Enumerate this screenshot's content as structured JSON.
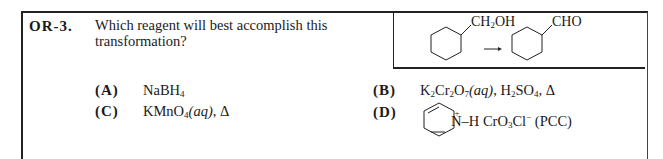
{
  "question": {
    "number": "OR-3.",
    "text": "Which reagent will best accomplish this transformation?"
  },
  "reaction": {
    "reactant_group": "CH2OH",
    "product_group": "CHO",
    "arrow": "→",
    "ring": "cyclohexane"
  },
  "options": [
    {
      "letter": "(A)",
      "text": "NaBH4"
    },
    {
      "letter": "(B)",
      "text": "K2Cr2O7(aq), H2SO4, Δ"
    },
    {
      "letter": "(C)",
      "text": "KMnO4(aq), Δ"
    },
    {
      "letter": "(D)",
      "text": "pyridinium N+–H CrO3Cl− (PCC)"
    }
  ],
  "labels": {
    "A_main": "NaBH",
    "A_sub": "4",
    "B_K": "K",
    "B_s1": "2",
    "B_Cr": "Cr",
    "B_s2": "2",
    "B_O": "O",
    "B_s3": "7",
    "B_aq": "(aq)",
    "B_rest1": ", H",
    "B_s4": "2",
    "B_SO": "SO",
    "B_s5": "4",
    "B_rest2": ", Δ",
    "C_main": "KMnO",
    "C_sub": "4",
    "C_aq": "(aq)",
    "C_rest": ", Δ",
    "D_N": "N",
    "D_plus": "+",
    "D_H": "–H",
    "D_Cr": "CrO",
    "D_s1": "3",
    "D_Cl": "Cl",
    "D_minus": "−",
    "D_pcc": " (PCC)",
    "rx_CH": "CH",
    "rx_sub": "2",
    "rx_OH": "OH",
    "rx_CHO": "CHO"
  }
}
